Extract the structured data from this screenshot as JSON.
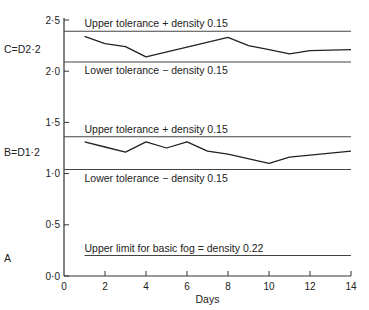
{
  "chart_data": {
    "type": "line",
    "title": "",
    "xlabel": "Days",
    "ylabel": "",
    "xlim": [
      0,
      14
    ],
    "ylim": [
      0,
      2.5
    ],
    "grid": false,
    "x_ticks": [
      0,
      2,
      4,
      6,
      8,
      10,
      12,
      14
    ],
    "y_ticks": [
      {
        "value": 0.0,
        "label": "0·0"
      },
      {
        "value": 0.5,
        "label": "0·5"
      },
      {
        "value": 1.0,
        "label": "1·0"
      },
      {
        "value": 1.5,
        "label": "1·5"
      },
      {
        "value": 2.0,
        "label": "2·0"
      },
      {
        "value": 2.5,
        "label": "2·5"
      }
    ],
    "series": [
      {
        "name": "C=D2·2",
        "x": [
          1,
          2,
          3,
          4,
          8,
          9,
          10,
          11,
          12,
          14
        ],
        "values": [
          2.34,
          2.27,
          2.24,
          2.14,
          2.33,
          2.25,
          2.21,
          2.17,
          2.2,
          2.21
        ]
      },
      {
        "name": "B=D1·2",
        "x": [
          1,
          2,
          3,
          4,
          5,
          6,
          7,
          8,
          10,
          11,
          12,
          14
        ],
        "values": [
          1.31,
          1.26,
          1.21,
          1.31,
          1.25,
          1.31,
          1.22,
          1.19,
          1.1,
          1.16,
          1.18,
          1.22
        ]
      }
    ],
    "reference_lines": [
      {
        "name": "C upper",
        "y": 2.39,
        "x_from": 0,
        "x_to": 14,
        "label": "Upper tolerance + density 0.15",
        "label_pos": "above"
      },
      {
        "name": "C lower",
        "y": 2.09,
        "x_from": 0,
        "x_to": 14,
        "label": "Lower tolerance − density 0.15",
        "label_pos": "below"
      },
      {
        "name": "B upper",
        "y": 1.36,
        "x_from": 0,
        "x_to": 14,
        "label": "Upper tolerance + density 0.15",
        "label_pos": "above"
      },
      {
        "name": "B lower",
        "y": 1.04,
        "x_from": 0,
        "x_to": 14,
        "label": "Lower tolerance − density 0.15",
        "label_pos": "below"
      },
      {
        "name": "A fog limit",
        "y": 0.2,
        "x_from": 1,
        "x_to": 14,
        "label": "Upper limit for basic fog = density 0.22",
        "label_pos": "above"
      }
    ],
    "side_labels": [
      {
        "text": "C=D2·2",
        "y": 2.22
      },
      {
        "text": "B=D1·2",
        "y": 1.21
      },
      {
        "text": "A",
        "y": 0.18
      }
    ]
  }
}
